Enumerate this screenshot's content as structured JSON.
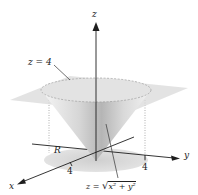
{
  "figure": {
    "type": "3d-surface-diagram",
    "axes": {
      "x": {
        "label": "x",
        "tick": "4"
      },
      "y": {
        "label": "y",
        "tick": "4"
      },
      "z": {
        "label": "z"
      }
    },
    "labels": {
      "plane": "z = 4",
      "cone_prefix": "z = ",
      "cone_radicand": "x² + y²",
      "region": "R"
    },
    "colors": {
      "plane": "#d9d9d9",
      "cone_light": "#efefef",
      "cone_dark": "#a9a9a9",
      "disk": "#dcdcdc",
      "axis": "#1e1e1e",
      "dotted": "#9a9a9a"
    }
  }
}
